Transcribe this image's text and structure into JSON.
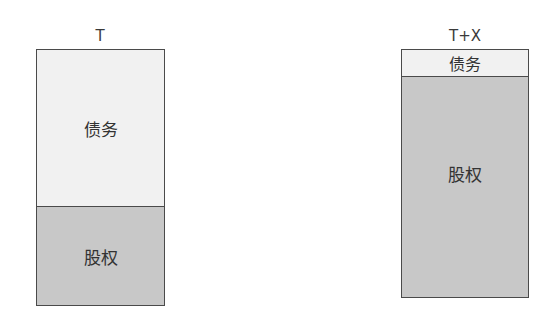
{
  "diagram": {
    "left": {
      "label": "T",
      "segments": [
        {
          "name": "debt",
          "label": "债务",
          "share": 0.6
        },
        {
          "name": "equity",
          "label": "股权",
          "share": 0.4
        }
      ]
    },
    "right": {
      "label": "T+X",
      "segments": [
        {
          "name": "debt",
          "label": "债务",
          "share": 0.11
        },
        {
          "name": "equity",
          "label": "股权",
          "share": 0.89
        }
      ]
    }
  },
  "colors": {
    "debt": "#f1f1f1",
    "equity": "#c8c8c8",
    "border": "#4a4a4a"
  }
}
